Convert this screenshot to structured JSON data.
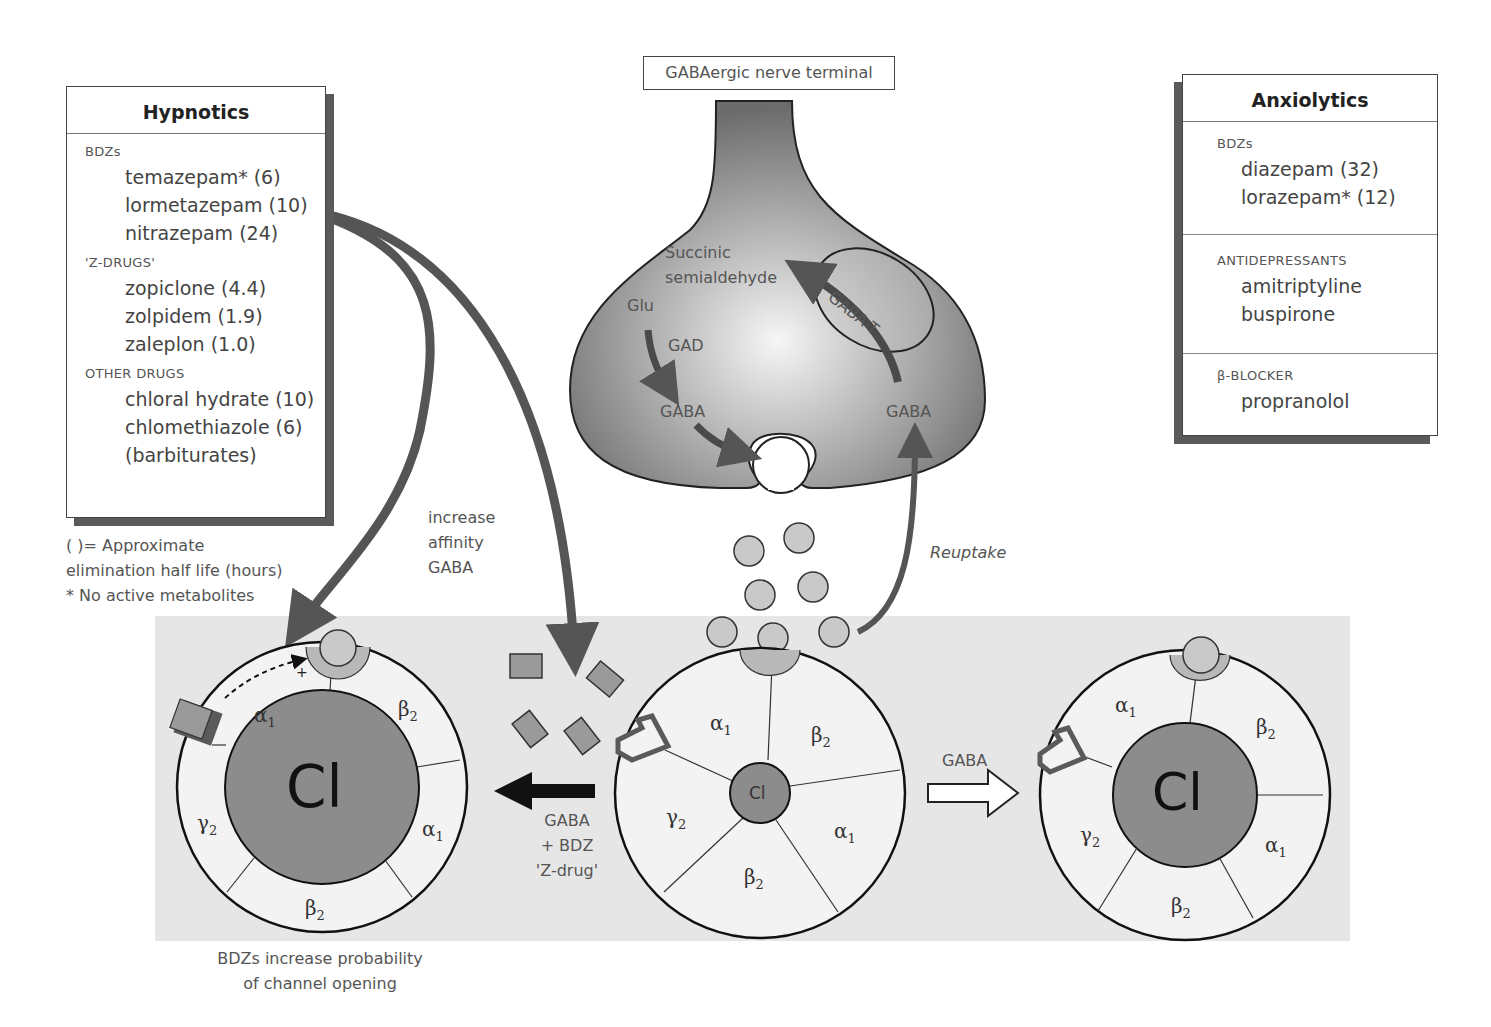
{
  "hypnotics": {
    "title": "Hypnotics",
    "sections": [
      {
        "label": "BDZs",
        "drugs": [
          "temazepam* (6)",
          "lormetazepam (10)",
          "nitrazepam (24)"
        ]
      },
      {
        "label": "'Z-DRUGS'",
        "drugs": [
          "zopiclone (4.4)",
          "zolpidem (1.9)",
          "zaleplon (1.0)"
        ]
      },
      {
        "label": "OTHER DRUGS",
        "drugs": [
          "chloral hydrate (10)",
          "chlomethiazole (6)",
          "(barbiturates)"
        ]
      }
    ],
    "notes": [
      "(  )= Approximate",
      "elimination half life (hours)",
      "* No active metabolites"
    ]
  },
  "anxiolytics": {
    "title": "Anxiolytics",
    "sections": [
      {
        "label": "BDZs",
        "drugs": [
          "diazepam (32)",
          "lorazepam* (12)"
        ]
      },
      {
        "label": "ANTIDEPRESSANTS",
        "drugs": [
          "amitriptyline",
          "buspirone"
        ]
      },
      {
        "label": "β-BLOCKER",
        "drugs": [
          "propranolol"
        ]
      }
    ]
  },
  "terminal": {
    "title": "GABAergic nerve terminal",
    "succinic": [
      "Succinic",
      "semialdehyde"
    ],
    "glu": "Glu",
    "gad": "GAD",
    "gaba_left": "GABA",
    "gaba_right": "GABA",
    "gaba_t": "GABA-T"
  },
  "labels": {
    "increase_affinity": [
      "increase",
      "affinity",
      "GABA"
    ],
    "reuptake": "Reuptake",
    "gaba_bdz": [
      "GABA",
      "+ BDZ",
      "'Z-drug'"
    ],
    "gaba_arrow": "GABA",
    "bdz_caption": [
      "BDZs increase probability",
      "of channel opening"
    ],
    "plus": "+"
  },
  "receptors": {
    "left": {
      "pore": "Cl",
      "subunits": [
        "α1",
        "β2",
        "α1",
        "β2",
        "γ2"
      ]
    },
    "center": {
      "pore": "Cl",
      "subunits": [
        "α1",
        "β2",
        "α1",
        "β2",
        "γ2"
      ]
    },
    "right": {
      "pore": "Cl",
      "subunits": [
        "α1",
        "β2",
        "α1",
        "β2",
        "γ2"
      ]
    }
  },
  "colors": {
    "panel": "#e6e6e6",
    "terminal_dark": "#6e6e6e",
    "terminal_light": "#f4f4f4",
    "pore": "#8c8c8c",
    "subunit_fill": "#f3f3f3",
    "arrow": "#5c5c5c",
    "gaba_ball": "#c9c9c9"
  }
}
